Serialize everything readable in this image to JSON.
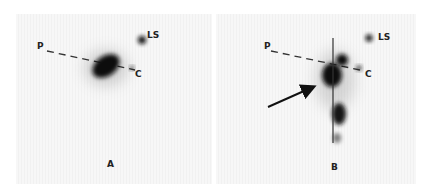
{
  "figure": {
    "panels": [
      {
        "id": "A",
        "caption": "A",
        "labels": {
          "P": "P",
          "LS": "LS",
          "C": "C"
        }
      },
      {
        "id": "B",
        "caption": "B",
        "labels": {
          "P": "P",
          "LS": "LS",
          "C": "C"
        }
      }
    ],
    "colors": {
      "spot": "#111111",
      "line": "#333333",
      "background": "#f4f4f4"
    }
  }
}
